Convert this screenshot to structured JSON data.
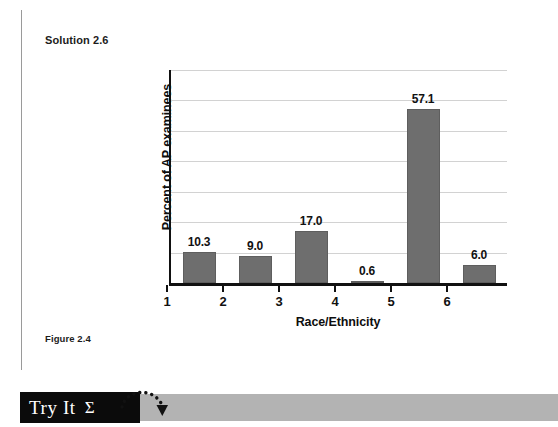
{
  "page": {
    "solution_heading": "Solution 2.6",
    "figure_caption": "Figure 2.4"
  },
  "banner": {
    "label": "Try It",
    "sigma": "Σ",
    "box_color": "#0b0b0b",
    "bar_color": "#b3b3b3",
    "arrow_icon": "dotted-curved-arrow-icon"
  },
  "chart_data": {
    "type": "bar",
    "title": "",
    "xlabel": "Race/Ethnicity",
    "ylabel": "Percent of AP examinees",
    "categories": [
      "1",
      "2",
      "3",
      "4",
      "5",
      "6"
    ],
    "values": [
      10.3,
      9.0,
      17.0,
      0.6,
      57.1,
      6.0
    ],
    "value_labels": [
      "10.3",
      "9.0",
      "17.0",
      "0.6",
      "57.1",
      "6.0"
    ],
    "ylim": [
      0,
      70
    ],
    "ytick_labels": [],
    "gridlines": 7,
    "grid": true,
    "legend": "none",
    "bar_color": "#6e6e6e",
    "axis_color": "#111111",
    "grid_color": "#d2d2d2"
  }
}
